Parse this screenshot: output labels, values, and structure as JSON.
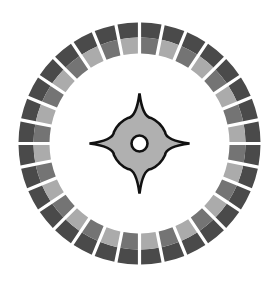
{
  "icon": {
    "name": "compass-icon",
    "center": [
      139.5,
      143.5
    ],
    "ring": {
      "segments": 32,
      "outer_radius": 121,
      "split_radius": 106,
      "inner_radius": 90,
      "gap_px": 3.2,
      "outer_color": "#4a4a4a",
      "inner_colors": [
        "#747474",
        "#ababab"
      ]
    },
    "star": {
      "body_radius": 28,
      "point_length": 50,
      "hole_radius": 8,
      "fill": "#b0b0b0",
      "stroke": "#111111"
    },
    "background": "#ffffff"
  }
}
